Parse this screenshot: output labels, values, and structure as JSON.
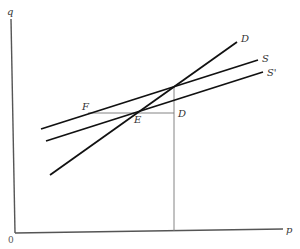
{
  "diagram": {
    "type": "supply-demand",
    "axes": {
      "y_label": "q",
      "x_label": "p",
      "origin_label": "0",
      "color": "#555555"
    },
    "curves": [
      {
        "id": "demand",
        "label": "D",
        "from": [
          50,
          175
        ],
        "to": [
          237,
          42
        ],
        "label_pos": [
          241,
          41
        ],
        "color": "#111111"
      },
      {
        "id": "supply",
        "label": "S",
        "from": [
          41,
          129
        ],
        "to": [
          258,
          60
        ],
        "label_pos": [
          262,
          62
        ],
        "color": "#111111"
      },
      {
        "id": "supply-shifted",
        "label": "S'",
        "from": [
          46,
          141
        ],
        "to": [
          263,
          72
        ],
        "label_pos": [
          267,
          76
        ],
        "color": "#111111"
      }
    ],
    "guides": {
      "horizontal": {
        "from": [
          88,
          113
        ],
        "to": [
          174,
          113
        ]
      },
      "vertical": {
        "from": [
          174,
          86
        ],
        "to": [
          174,
          231
        ]
      },
      "color": "#777777"
    },
    "points": [
      {
        "label": "F",
        "pos": [
          82,
          110
        ]
      },
      {
        "label": "E",
        "pos": [
          134,
          123
        ]
      },
      {
        "label": "D",
        "pos": [
          178,
          117
        ]
      }
    ]
  }
}
